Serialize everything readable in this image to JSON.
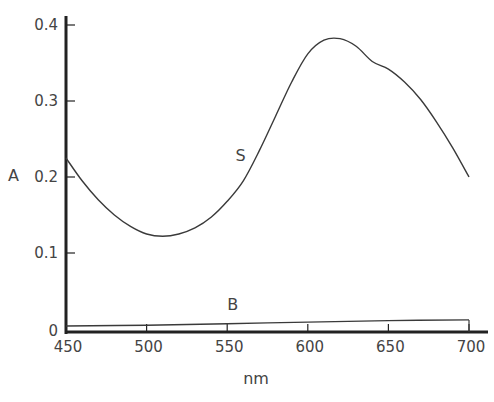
{
  "chart_data": {
    "type": "line",
    "title": "",
    "xlabel": "nm",
    "ylabel": "A",
    "xlim": [
      450,
      700
    ],
    "ylim": [
      0,
      0.4
    ],
    "grid": false,
    "x_ticks": [
      "450",
      "500",
      "550",
      "600",
      "650",
      "700"
    ],
    "y_ticks": [
      "0",
      "0.1",
      "0.2",
      "0.3",
      "0.4"
    ],
    "series": [
      {
        "name": "S",
        "x": [
          450,
          460,
          470,
          480,
          490,
          500,
          510,
          520,
          530,
          540,
          550,
          560,
          570,
          580,
          590,
          600,
          610,
          620,
          630,
          640,
          650,
          660,
          670,
          680,
          690,
          700
        ],
        "values": [
          0.225,
          0.195,
          0.17,
          0.15,
          0.135,
          0.125,
          0.122,
          0.125,
          0.133,
          0.147,
          0.168,
          0.195,
          0.235,
          0.28,
          0.325,
          0.362,
          0.38,
          0.382,
          0.372,
          0.352,
          0.342,
          0.325,
          0.302,
          0.272,
          0.238,
          0.2
        ]
      },
      {
        "name": "B",
        "x": [
          450,
          500,
          550,
          600,
          650,
          700
        ],
        "values": [
          0.004,
          0.005,
          0.007,
          0.009,
          0.011,
          0.012
        ]
      }
    ],
    "annotations": [
      {
        "text": "S",
        "x": 565,
        "y": 0.21
      },
      {
        "text": "B",
        "x": 560,
        "y": 0.025
      }
    ]
  },
  "labels": {
    "ylabel": "A",
    "xlabel": "nm",
    "series_s": "S",
    "series_b": "B"
  },
  "colors": {
    "line": "#3a3a3a",
    "axis": "#222222",
    "text": "#444444"
  }
}
